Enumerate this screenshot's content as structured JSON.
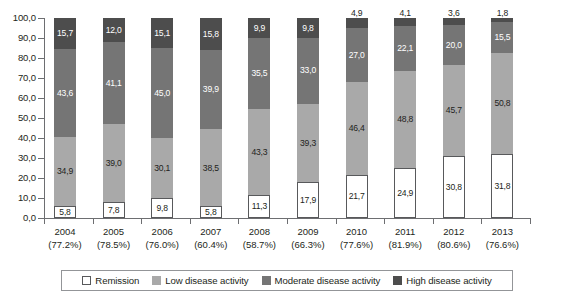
{
  "chart_data": {
    "type": "bar",
    "stacked": true,
    "title": "",
    "subtitle": "",
    "xlabel": "",
    "ylabel": "",
    "ylim": [
      0,
      100
    ],
    "grid": false,
    "legend_position": "bottom",
    "decimal_separator_values": ",",
    "decimal_separator_percent": ".",
    "categories": [
      "2004",
      "2005",
      "2006",
      "2007",
      "2008",
      "2009",
      "2010",
      "2011",
      "2012",
      "2013"
    ],
    "category_sublabels": [
      "(77.2%)",
      "(78.5%)",
      "(76.0%)",
      "(60.4%)",
      "(58.7%)",
      "(66.3%)",
      "(77.6%)",
      "(81.9%)",
      "(80.6%)",
      "(76.6%)"
    ],
    "ytick_labels": [
      "0,0",
      "10,0",
      "20,0",
      "30,0",
      "40,0",
      "50,0",
      "60,0",
      "70,0",
      "80,0",
      "90,0",
      "100,0"
    ],
    "ytick_values": [
      0,
      10,
      20,
      30,
      40,
      50,
      60,
      70,
      80,
      90,
      100
    ],
    "series": [
      {
        "name": "Remission",
        "color": "#ffffff",
        "border": "#58595b",
        "values": [
          5.8,
          7.8,
          9.8,
          5.8,
          11.3,
          17.9,
          21.7,
          24.9,
          30.8,
          31.8
        ],
        "labels": [
          "5,8",
          "7,8",
          "9,8",
          "5,8",
          "11,3",
          "17,9",
          "21,7",
          "24,9",
          "30,8",
          "31,8"
        ]
      },
      {
        "name": "Low disease activity",
        "color": "#a9a9a9",
        "values": [
          34.9,
          39.0,
          30.1,
          38.5,
          43.3,
          39.3,
          46.4,
          48.8,
          45.7,
          50.8
        ],
        "labels": [
          "34,9",
          "39,0",
          "30,1",
          "38,5",
          "43,3",
          "39,3",
          "46,4",
          "48,8",
          "45,7",
          "50,8"
        ]
      },
      {
        "name": "Moderate disease activity",
        "color": "#757575",
        "values": [
          43.6,
          41.1,
          45.0,
          39.9,
          35.5,
          33.0,
          27.0,
          22.1,
          20.0,
          15.5
        ],
        "labels": [
          "43,6",
          "41,1",
          "45,0",
          "39,9",
          "35,5",
          "33,0",
          "27,0",
          "22,1",
          "20,0",
          "15,5"
        ]
      },
      {
        "name": "High disease activity",
        "color": "#4d4d4d",
        "values": [
          15.7,
          12.0,
          15.1,
          15.8,
          9.9,
          9.8,
          4.9,
          4.1,
          3.6,
          1.8
        ],
        "labels": [
          "15,7",
          "12,0",
          "15,1",
          "15,8",
          "9,9",
          "9,8",
          "4,9",
          "4,1",
          "3,6",
          "1,8"
        ]
      }
    ]
  },
  "legend": {
    "items": [
      {
        "label": "Remission",
        "swatch": "remission"
      },
      {
        "label": "Low disease activity",
        "swatch": "low"
      },
      {
        "label": "Moderate disease activity",
        "swatch": "moderate"
      },
      {
        "label": "High disease activity",
        "swatch": "high"
      }
    ]
  }
}
